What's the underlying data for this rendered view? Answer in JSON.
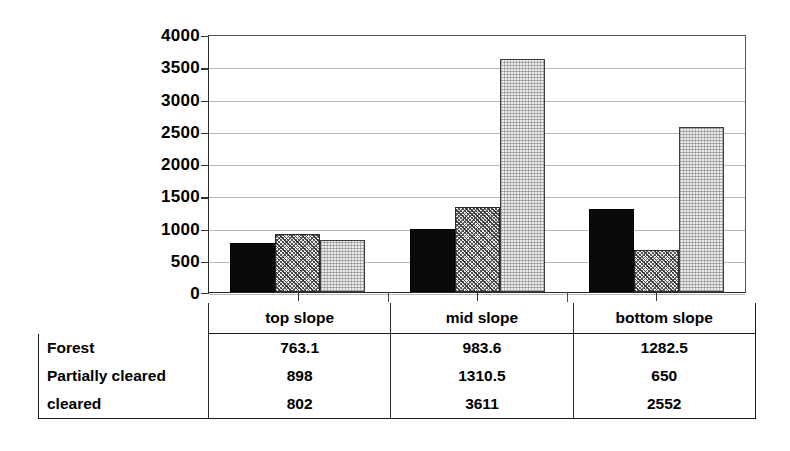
{
  "chart_data": {
    "type": "bar",
    "title": "",
    "subtitle": "",
    "xlabel": "",
    "ylabel": "",
    "categories": [
      "top slope",
      "mid slope",
      "bottom slope"
    ],
    "series": [
      {
        "name": "Forest",
        "pattern": "solid-black",
        "values": [
          763.1,
          983.6,
          1282.5
        ]
      },
      {
        "name": "Partially cleared",
        "pattern": "cross-hatch",
        "values": [
          898,
          1310.5,
          650
        ]
      },
      {
        "name": "cleared",
        "pattern": "light-stipple",
        "values": [
          802,
          3611,
          2552
        ]
      }
    ],
    "ylim": [
      0,
      4000
    ],
    "ytick_step": 500,
    "yticks": [
      0,
      500,
      1000,
      1500,
      2000,
      2500,
      3000,
      3500,
      4000
    ],
    "ytick_labels": [
      "0",
      "500",
      "1000",
      "1500",
      "2000",
      "2500",
      "3000",
      "3500",
      "4000"
    ],
    "grid": true,
    "grid_axis": "y",
    "legend": "none",
    "legend_position": "table-below"
  },
  "table": {
    "header": {
      "corner": "",
      "columns": [
        "top slope",
        "mid slope",
        "bottom slope"
      ]
    },
    "rows": [
      {
        "label": "Forest",
        "cells": [
          "763.1",
          "983.6",
          "1282.5"
        ]
      },
      {
        "label": "Partially cleared",
        "cells": [
          "898",
          "1310.5",
          "650"
        ]
      },
      {
        "label": "cleared",
        "cells": [
          "802",
          "3611",
          "2552"
        ]
      }
    ]
  },
  "colors": {
    "forest": "#0a0a0a",
    "partially_cleared": "#808080",
    "cleared": "#ececec",
    "gridline": "#b9b9b9",
    "axis": "#2a2a2a",
    "background": "#ffffff"
  }
}
